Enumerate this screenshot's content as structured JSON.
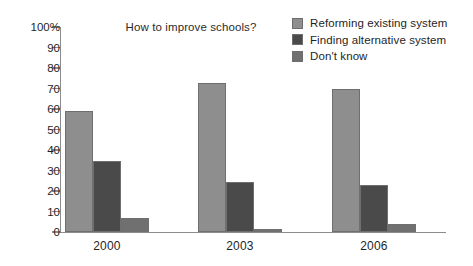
{
  "chart_data": {
    "type": "bar",
    "title": "How to improve schools?",
    "xlabel": "",
    "ylabel": "",
    "categories": [
      "2000",
      "2003",
      "2006"
    ],
    "ylim": [
      0,
      100
    ],
    "ytick_labels": [
      "100%",
      "90",
      "80",
      "70",
      "60",
      "50",
      "40",
      "30",
      "20",
      "10",
      "0"
    ],
    "ytick_values": [
      100,
      90,
      80,
      70,
      60,
      50,
      40,
      30,
      20,
      10,
      0
    ],
    "grid": false,
    "legend_position": "top-right",
    "series": [
      {
        "name": "Reforming existing system",
        "color": "#8e8e8e",
        "values": [
          59,
          72.5,
          70
        ]
      },
      {
        "name": "Finding alternative system",
        "color": "#4a4a4a",
        "values": [
          34.5,
          24.5,
          23
        ]
      },
      {
        "name": "Don't know",
        "color": "#707070",
        "values": [
          7,
          1.5,
          4
        ]
      }
    ]
  }
}
